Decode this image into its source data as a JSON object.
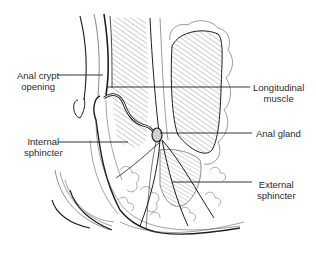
{
  "figure": {
    "colors": {
      "line": "#1e1e1e",
      "hatch": "#6a6a6a",
      "label": "#2a2a2a",
      "background": "#ffffff"
    }
  },
  "labels": {
    "anal_crypt_opening": {
      "line1": "Anal crypt",
      "line2": "opening"
    },
    "longitudinal_muscle": {
      "line1": "Longitudinal",
      "line2": "muscle"
    },
    "internal_sphincter": {
      "line1": "Internal",
      "line2": "sphincter"
    },
    "anal_gland": {
      "line1": "Anal gland"
    },
    "external_sphincter": {
      "line1": "External",
      "line2": "sphincter"
    }
  }
}
